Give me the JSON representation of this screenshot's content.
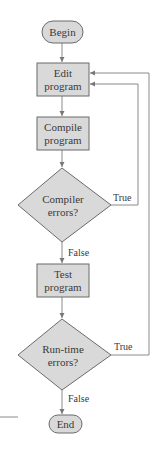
{
  "diagram": {
    "type": "flowchart",
    "colors": {
      "node_fill": "#d9d9d9",
      "node_stroke": "#6b6b6b",
      "edge": "#8a8a8a",
      "text": "#3a3a3a"
    },
    "nodes": {
      "begin": {
        "shape": "terminal",
        "label": "Begin"
      },
      "edit": {
        "shape": "process",
        "line1": "Edit",
        "line2": "program"
      },
      "compile": {
        "shape": "process",
        "line1": "Compile",
        "line2": "program"
      },
      "compiler_errors": {
        "shape": "decision",
        "line1": "Compiler",
        "line2": "errors?"
      },
      "test": {
        "shape": "process",
        "line1": "Test",
        "line2": "program"
      },
      "runtime_errors": {
        "shape": "decision",
        "line1": "Run-time",
        "line2": "errors?"
      },
      "end": {
        "shape": "terminal",
        "label": "End"
      }
    },
    "edges": {
      "compiler_true": "True",
      "compiler_false": "False",
      "runtime_true": "True",
      "runtime_false": "False"
    }
  }
}
